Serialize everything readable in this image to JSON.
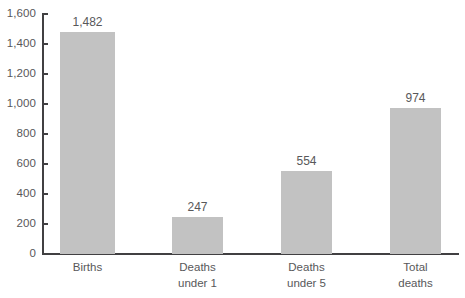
{
  "chart_data": {
    "type": "bar",
    "title": "",
    "subtitle": "",
    "xlabel": "",
    "ylabel": "",
    "ylim": [
      0,
      1600
    ],
    "ytick_step": 200,
    "grid": false,
    "legend": null,
    "categories": [
      "Births",
      "Deaths under 1",
      "Deaths under 5",
      "Total deaths"
    ],
    "values": [
      1482,
      247,
      554,
      974
    ],
    "value_labels": [
      "1,482",
      "247",
      "554",
      "974"
    ],
    "ytick_labels": [
      "1,600",
      "1,400",
      "1,200",
      "1,000",
      "800",
      "600",
      "400",
      "200",
      "0"
    ],
    "ytick_values": [
      1600,
      1400,
      1200,
      1000,
      800,
      600,
      400,
      200,
      0
    ],
    "bar_color": "#c2c2c2",
    "axis_color": "#414042",
    "text_color": "#58585a",
    "background": "#ffffff"
  },
  "categories_display": [
    {
      "line1": "Births",
      "line2": ""
    },
    {
      "line1": "Deaths",
      "line2": "under 1"
    },
    {
      "line1": "Deaths",
      "line2": "under 5"
    },
    {
      "line1": "Total",
      "line2": "deaths"
    }
  ]
}
